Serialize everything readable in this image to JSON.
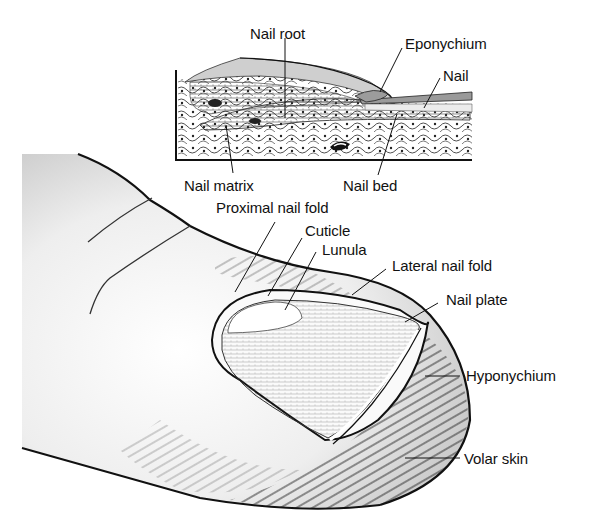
{
  "figure": {
    "inset": {
      "labels": [
        {
          "id": "nail-root",
          "text": "Nail root"
        },
        {
          "id": "eponychium",
          "text": "Eponychium"
        },
        {
          "id": "nail",
          "text": "Nail"
        },
        {
          "id": "nail-matrix",
          "text": "Nail matrix"
        },
        {
          "id": "nail-bed",
          "text": "Nail bed"
        }
      ]
    },
    "finger": {
      "labels": [
        {
          "id": "proximal-nail-fold",
          "text": "Proximal nail fold"
        },
        {
          "id": "cuticle",
          "text": "Cuticle"
        },
        {
          "id": "lunula",
          "text": "Lunula"
        },
        {
          "id": "lateral-nail-fold",
          "text": "Lateral nail fold"
        },
        {
          "id": "nail-plate",
          "text": "Nail plate"
        },
        {
          "id": "hyponychium",
          "text": "Hyponychium"
        },
        {
          "id": "volar-skin",
          "text": "Volar skin"
        }
      ]
    },
    "colors": {
      "ink": "#111111",
      "paper": "#ffffff",
      "shade": "#d9d9d9"
    }
  }
}
